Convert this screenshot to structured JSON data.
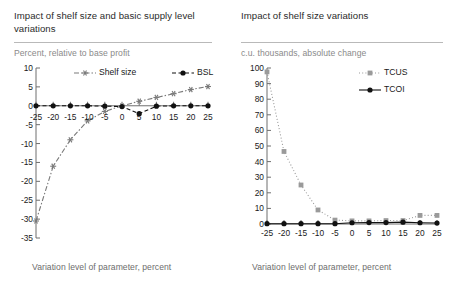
{
  "panels": [
    {
      "title": "Impact of shelf size and basic supply level variations",
      "subtitle": "Percent, relative to base profit",
      "xcaption": "Variation level of parameter, percent"
    },
    {
      "title": "Impact of shelf size variations",
      "subtitle": "c.u. thousands, absolute change",
      "xcaption": "Variation level of parameter, percent"
    }
  ],
  "colors": {
    "shelf_size": "#7a7a7a",
    "bsl": "#111111",
    "tcus": "#9a9a9a",
    "tcoi": "#111111",
    "axis": "#6f6f6f",
    "rule": "#b9b9b9",
    "subtitle": "#8a8a8a",
    "caption": "#6d6d6d"
  },
  "chart_data": [
    {
      "type": "line",
      "title": "Impact of shelf size and basic supply level variations",
      "subtitle": "Percent, relative to base profit",
      "xlabel": "Variation level of parameter, percent",
      "ylabel": "Percent, relative to base profit",
      "x": [
        -25,
        -20,
        -15,
        -10,
        -5,
        0,
        5,
        10,
        15,
        20,
        25
      ],
      "xticks": [
        "-25",
        "-20",
        "-15",
        "-10",
        "-5",
        "0",
        "5",
        "10",
        "15",
        "20",
        "25"
      ],
      "yticks": [
        "10",
        "5",
        "0",
        "-5",
        "-10",
        "-15",
        "-20",
        "-25",
        "-30",
        "-35"
      ],
      "xlim": [
        -25,
        25
      ],
      "ylim": [
        -35,
        10
      ],
      "grid": false,
      "legend_position": "top-right",
      "series": [
        {
          "name": "Shelf size",
          "color": "#7a7a7a",
          "marker": "star",
          "linestyle": "dashdot",
          "values": [
            -30.5,
            -16.0,
            -9.0,
            -4.0,
            -1.5,
            0.0,
            1.2,
            2.2,
            3.2,
            4.3,
            5.1
          ]
        },
        {
          "name": "BSL",
          "color": "#111111",
          "marker": "circle",
          "linestyle": "dashed",
          "values": [
            0.0,
            0.0,
            0.0,
            0.0,
            -0.1,
            -0.2,
            -2.1,
            -0.1,
            0.0,
            0.0,
            0.0
          ]
        }
      ]
    },
    {
      "type": "line",
      "title": "Impact of shelf size variations",
      "subtitle": "c.u. thousands, absolute change",
      "xlabel": "Variation level of parameter, percent",
      "ylabel": "c.u. thousands, absolute change",
      "x": [
        -25,
        -20,
        -15,
        -10,
        -5,
        0,
        5,
        10,
        15,
        20,
        25
      ],
      "xticks": [
        "-25",
        "-20",
        "-15",
        "-10",
        "-5",
        "0",
        "5",
        "10",
        "15",
        "20",
        "25"
      ],
      "yticks": [
        "100",
        "90",
        "80",
        "70",
        "60",
        "50",
        "40",
        "30",
        "20",
        "10",
        "0"
      ],
      "xlim": [
        -25,
        25
      ],
      "ylim": [
        0,
        100
      ],
      "grid": false,
      "legend_position": "top-right",
      "series": [
        {
          "name": "TCUS",
          "color": "#9a9a9a",
          "marker": "square",
          "linestyle": "dotted",
          "values": [
            97.5,
            46.5,
            25.0,
            9.0,
            2.5,
            2.0,
            2.0,
            2.2,
            2.2,
            5.5,
            5.5
          ]
        },
        {
          "name": "TCOI",
          "color": "#111111",
          "marker": "circle",
          "linestyle": "solid",
          "values": [
            0.2,
            0.2,
            0.2,
            0.2,
            0.2,
            0.8,
            0.9,
            0.9,
            1.2,
            0.8,
            0.6
          ]
        }
      ]
    }
  ]
}
